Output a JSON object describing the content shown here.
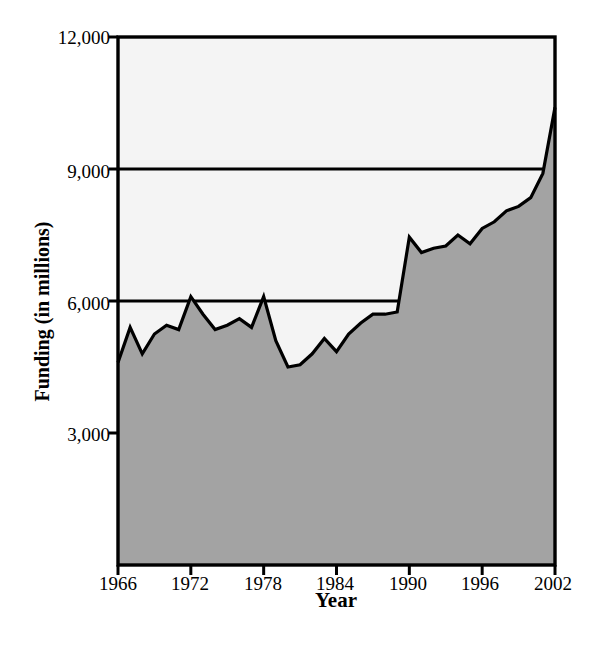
{
  "chart_data": {
    "type": "area",
    "title": "",
    "xlabel": "Year",
    "ylabel": "Funding (in millions)",
    "xlim": [
      1966,
      2002
    ],
    "ylim": [
      0,
      12000
    ],
    "grid": true,
    "legend": "none",
    "fill_color": "#a3a3a3",
    "line_color": "#000000",
    "plot_background": "#f4f4f4",
    "y_ticks": [
      {
        "value": 12000,
        "label": "12,000"
      },
      {
        "value": 9000,
        "label": "9,000"
      },
      {
        "value": 6000,
        "label": "6,000"
      },
      {
        "value": 3000,
        "label": "3,000"
      }
    ],
    "x_ticks": [
      {
        "value": 1966,
        "label": "1966"
      },
      {
        "value": 1972,
        "label": "1972"
      },
      {
        "value": 1978,
        "label": "1978"
      },
      {
        "value": 1984,
        "label": "1984"
      },
      {
        "value": 1990,
        "label": "1990"
      },
      {
        "value": 1996,
        "label": "1996"
      },
      {
        "value": 2002,
        "label": "2002"
      }
    ],
    "x": [
      1966,
      1967,
      1968,
      1969,
      1970,
      1971,
      1972,
      1973,
      1974,
      1975,
      1976,
      1977,
      1978,
      1979,
      1980,
      1981,
      1982,
      1983,
      1984,
      1985,
      1986,
      1987,
      1988,
      1989,
      1990,
      1991,
      1992,
      1993,
      1994,
      1995,
      1996,
      1997,
      1998,
      1999,
      2000,
      2001,
      2002
    ],
    "values": [
      4600,
      5400,
      4800,
      5250,
      5450,
      5350,
      6100,
      5700,
      5350,
      5450,
      5600,
      5400,
      6100,
      5100,
      4500,
      4550,
      4800,
      5150,
      4850,
      5250,
      5500,
      5700,
      5700,
      5750,
      7450,
      7100,
      7200,
      7250,
      7500,
      7300,
      7650,
      7800,
      8050,
      8150,
      8350,
      8900,
      10400
    ],
    "series_name": "Funding"
  },
  "axes": {
    "y_title": "Funding (in millions)",
    "x_title": "Year"
  }
}
